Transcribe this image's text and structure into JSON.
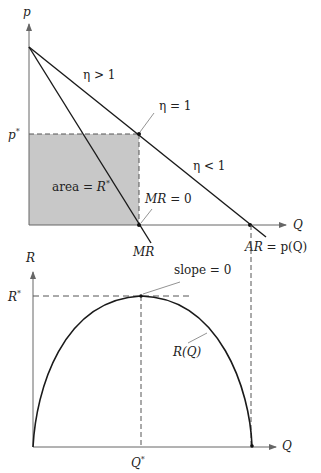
{
  "colors": {
    "line": "#1a1a1a",
    "axis": "#555555",
    "fill": "#c8c8c8",
    "dash": "#555555",
    "leader": "#666666"
  },
  "top_panel": {
    "y_axis_label": "p",
    "x_axis_label": "Q",
    "price_star_label": "p",
    "price_star_sup": "*",
    "area_label_prefix": "area = ",
    "area_label_var": "R",
    "area_label_sup": "*",
    "elastic_label": "η > 1",
    "unit_elastic_label": "η = 1",
    "inelastic_label": "η < 1",
    "mr_zero_label_var": "MR",
    "mr_zero_label_rest": " = 0",
    "mr_curve_label": "MR",
    "ar_curve_label_var": "AR",
    "ar_curve_label_rest": " = p(Q)"
  },
  "bottom_panel": {
    "y_axis_label": "R",
    "x_axis_label": "Q",
    "rev_star_label": "R",
    "rev_star_sup": "*",
    "slope_label": "slope = 0",
    "curve_label": "R(Q)",
    "q_star_label": "Q",
    "q_star_sup": "*"
  }
}
